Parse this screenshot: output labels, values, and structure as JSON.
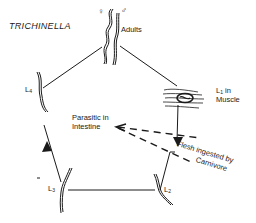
{
  "title": "TRICHINELLA",
  "stages": {
    "adults": {
      "label": "Adults",
      "female_symbol": "♀",
      "male_symbol": "♂"
    },
    "l1": {
      "prefix": "L",
      "sub": "1",
      "line1_suffix": " in",
      "line2": "Muscle"
    },
    "l2": {
      "prefix": "L",
      "sub": "2"
    },
    "l3": {
      "prefix": "L",
      "sub": "3"
    },
    "l4": {
      "prefix": "L",
      "sub": "4"
    }
  },
  "annotations": {
    "intestine_line1": "Parasitic in",
    "intestine_line2": "Intestine",
    "ingestion_line1": "Flesh ingested by",
    "ingestion_line2": "Carnivore"
  },
  "colors": {
    "ink": "#1a1a1a",
    "background": "#ffffff"
  }
}
